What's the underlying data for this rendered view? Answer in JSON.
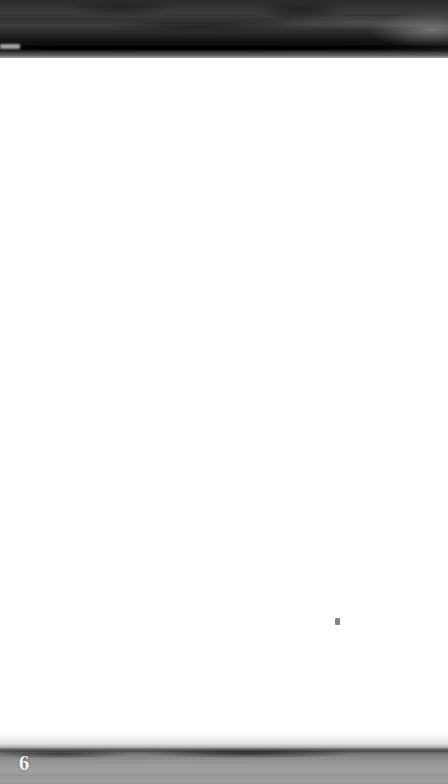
{
  "document": {
    "type": "scanned-book-page",
    "page_number": "6",
    "body_text": "",
    "body_state": "blank"
  },
  "regions": {
    "top_shadow_band": {
      "name": "top-scan-shadow",
      "label": "",
      "color": "#2a2a2a",
      "height_px": 58
    },
    "page_body": {
      "name": "blank-page-surface",
      "label": "",
      "color": "#ffffff",
      "height_px": 690
    },
    "bottom_band": {
      "name": "bottom-scan-shadow",
      "label": "",
      "color": "#9a9a9a",
      "height_px": 36
    }
  },
  "artifacts": {
    "ink_speck": {
      "label": "",
      "color": "#5a5860"
    }
  }
}
